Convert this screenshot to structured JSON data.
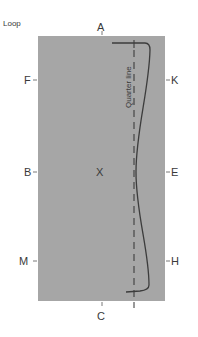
{
  "title": "Loop",
  "arena": {
    "fill": "#a6a6a6",
    "letters": {
      "top": "A",
      "bottom": "C",
      "left_upper": "F",
      "left_middle": "B",
      "left_lower": "M",
      "right_upper": "K",
      "right_middle": "E",
      "right_lower": "H",
      "center": "X"
    }
  },
  "quarter_line_label": "Quarter line",
  "path_color": "#3c3c3c"
}
